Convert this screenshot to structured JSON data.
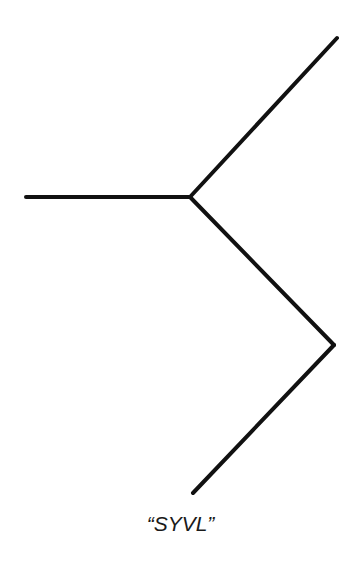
{
  "figure": {
    "caption": "“SYVL”",
    "stroke_color": "#111111",
    "stroke_width": 4,
    "points": {
      "left_end": [
        26,
        197
      ],
      "junction": [
        190,
        197
      ],
      "top_right_end": [
        337,
        38
      ],
      "right_vertex": [
        334,
        345
      ],
      "bottom_end": [
        193,
        493
      ]
    }
  }
}
